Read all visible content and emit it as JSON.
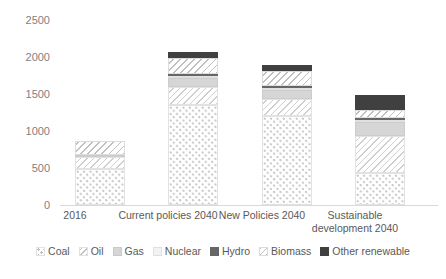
{
  "chart_data": {
    "type": "bar",
    "stacked": true,
    "title": "",
    "xlabel": "",
    "ylabel": "",
    "ylim": [
      0,
      2500
    ],
    "yticks": [
      0,
      500,
      1000,
      1500,
      2000,
      2500
    ],
    "grid": false,
    "legend_position": "bottom",
    "categories": [
      "2016",
      "Current policies 2040",
      "New Policies 2040",
      "Sustainable development 2040"
    ],
    "series": [
      {
        "name": "Coal",
        "values": [
          480,
          1350,
          1200,
          430
        ]
      },
      {
        "name": "Oil",
        "values": [
          175,
          250,
          235,
          500
        ]
      },
      {
        "name": "Gas",
        "values": [
          22,
          120,
          115,
          190
        ]
      },
      {
        "name": "Nuclear",
        "values": [
          0,
          20,
          20,
          25
        ]
      },
      {
        "name": "Hydro",
        "values": [
          0,
          25,
          25,
          30
        ]
      },
      {
        "name": "Biomass",
        "values": [
          180,
          215,
          215,
          105
        ]
      },
      {
        "name": "Other renewable",
        "values": [
          5,
          85,
          80,
          205
        ]
      }
    ],
    "totals": [
      862,
      2065,
      1890,
      1485
    ]
  },
  "legend": {
    "items": [
      {
        "label": "Coal",
        "swatch": "coal-dotted-swatch"
      },
      {
        "label": "Oil",
        "swatch": "oil-hatch-swatch"
      },
      {
        "label": "Gas",
        "swatch": "gas-solid-swatch"
      },
      {
        "label": "Nuclear",
        "swatch": "nuclear-solid-swatch"
      },
      {
        "label": "Hydro",
        "swatch": "hydro-solid-swatch"
      },
      {
        "label": "Biomass",
        "swatch": "biomass-hatch-swatch"
      },
      {
        "label": "Other renewable",
        "swatch": "other-renewable-solid-swatch"
      }
    ]
  },
  "axis": {
    "y_tick_labels": [
      "2500",
      "2000",
      "1500",
      "1000",
      "500",
      "0"
    ]
  },
  "x_labels": [
    {
      "line1": "2016",
      "line2": ""
    },
    {
      "line1": "Current policies 2040",
      "line2": ""
    },
    {
      "line1": "New Policies 2040",
      "line2": ""
    },
    {
      "line1": "Sustainable",
      "line2": "development 2040"
    }
  ],
  "colors": {
    "coal": "#c8c8c8",
    "oil": "#cfcfcf",
    "gas": "#d6d6d6",
    "nuclear": "#f2f2f2",
    "hydro": "#666666",
    "biomass": "#bfbfbf",
    "other_renewable": "#404040",
    "text": "#595959",
    "axis": "#d9d9d9"
  }
}
